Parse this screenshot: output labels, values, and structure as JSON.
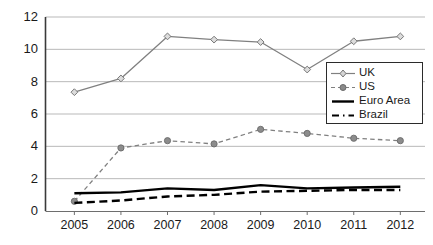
{
  "chart_data": {
    "type": "line",
    "title": "",
    "subtitle": "",
    "xlabel": "",
    "ylabel": "",
    "categories": [
      "2005",
      "2006",
      "2007",
      "2008",
      "2009",
      "2010",
      "2011",
      "2012"
    ],
    "x": [
      2005,
      2006,
      2007,
      2008,
      2009,
      2010,
      2011,
      2012
    ],
    "ylim": [
      0,
      12
    ],
    "yticks": [
      0,
      2,
      4,
      6,
      8,
      10,
      12
    ],
    "ytick_labels": [
      "0",
      "2",
      "4",
      "6",
      "8",
      "10",
      "12"
    ],
    "grid": true,
    "grid_axis": "y",
    "legend_position": "right-middle",
    "series": [
      {
        "name": "UK",
        "values": [
          7.35,
          8.2,
          10.8,
          10.6,
          10.45,
          8.75,
          10.5,
          10.8
        ],
        "color": "#808080",
        "linestyle": "solid",
        "marker": "open-diamond"
      },
      {
        "name": "US",
        "values": [
          0.6,
          3.9,
          4.35,
          4.15,
          5.05,
          4.8,
          4.5,
          4.35
        ],
        "color": "#808080",
        "linestyle": "dashed",
        "marker": "filled-circle"
      },
      {
        "name": "Euro Area",
        "values": [
          1.1,
          1.15,
          1.4,
          1.3,
          1.6,
          1.4,
          1.45,
          1.5
        ],
        "color": "#000000",
        "linestyle": "solid",
        "marker": "none"
      },
      {
        "name": "Brazil",
        "values": [
          0.5,
          0.65,
          0.9,
          1.0,
          1.2,
          1.25,
          1.3,
          1.3
        ],
        "color": "#000000",
        "linestyle": "dashed",
        "marker": "none"
      }
    ]
  },
  "axes": {
    "y_axis_name": "y-axis",
    "x_axis_name": "x-axis"
  },
  "legend": {
    "entries": [
      {
        "label": "UK"
      },
      {
        "label": "US"
      },
      {
        "label": "Euro Area"
      },
      {
        "label": "Brazil"
      }
    ]
  },
  "colors": {
    "gray_series": "#808080",
    "black_series": "#000000",
    "gridline": "#b9b9b9",
    "axis": "#3a3a3a",
    "text": "#1a1a1a"
  }
}
